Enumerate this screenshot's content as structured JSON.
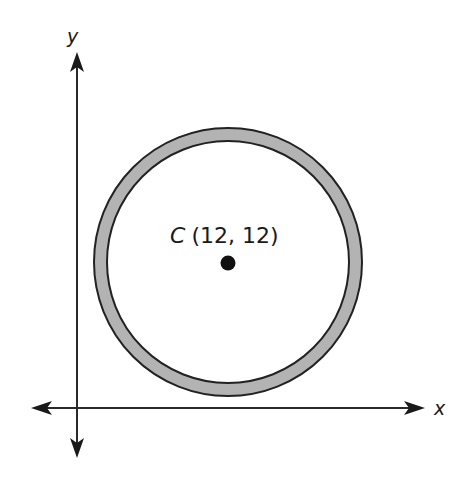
{
  "diagram": {
    "type": "coordinate-plane-annulus",
    "axes": {
      "x_label": "x",
      "y_label": "y"
    },
    "center": {
      "name": "C",
      "coords_text": "(12, 12)",
      "x": 12,
      "y": 12
    },
    "shapes": [
      {
        "kind": "ring",
        "fill": "#b3b3b3",
        "stroke": "#222222"
      },
      {
        "kind": "point",
        "fill": "#111111"
      }
    ],
    "colors": {
      "line": "#2a2a2a",
      "ring_fill": "#b3b3b3",
      "background": "#ffffff"
    }
  }
}
